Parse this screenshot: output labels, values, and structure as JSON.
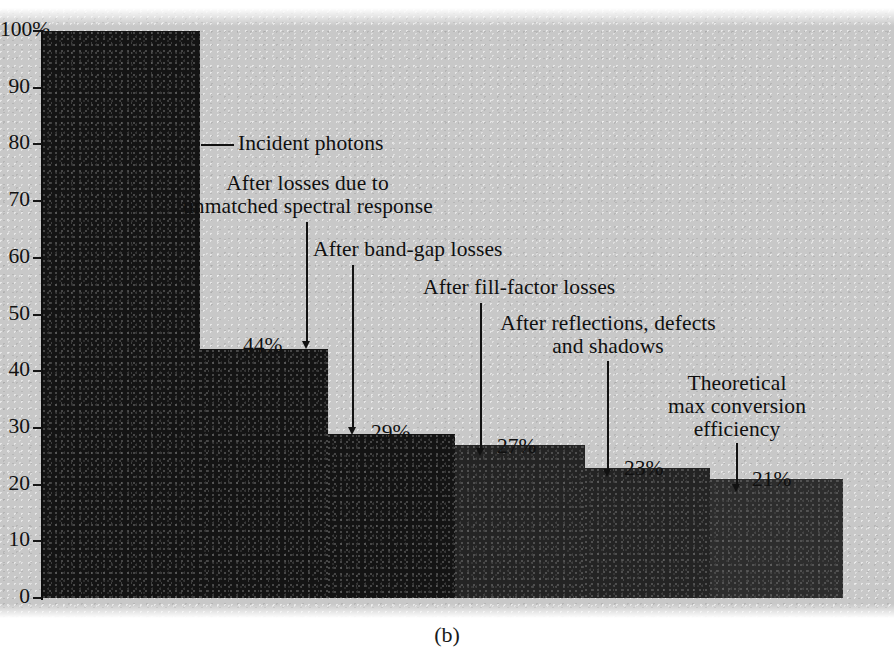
{
  "figure": {
    "caption": "(b)",
    "background_color": "#c8c8c8",
    "bar_color": "#141414"
  },
  "chart_data": {
    "type": "bar",
    "title": "",
    "subtitle": "",
    "xlabel": "",
    "ylabel": "",
    "ylim": [
      0,
      100
    ],
    "grid": false,
    "legend": "none",
    "y_tick_labels": [
      "100%",
      "90",
      "80",
      "70",
      "60",
      "50",
      "40",
      "30",
      "20",
      "10",
      "0"
    ],
    "y_ticks": [
      100,
      90,
      80,
      70,
      60,
      50,
      40,
      30,
      20,
      10,
      0
    ],
    "categories": [
      "Incident photons",
      "After losses due to unmatched spectral response",
      "After band-gap losses",
      "After fill-factor losses",
      "After reflections, defects and shadows",
      "Theoretical max conversion efficiency"
    ],
    "values": [
      100,
      44,
      29,
      27,
      23,
      21
    ],
    "value_labels": [
      "100%",
      "44%",
      "29%",
      "27%",
      "23%",
      "21%"
    ]
  },
  "annotations": [
    {
      "id": "incident-photons",
      "line1": "Incident photons",
      "line2": "",
      "value_label": "100%"
    },
    {
      "id": "unmatched-spectral-response",
      "line1": "After losses due to",
      "line2": "unmatched spectral response",
      "value_label": "44%"
    },
    {
      "id": "band-gap-losses",
      "line1": "After band-gap losses",
      "line2": "",
      "value_label": "29%"
    },
    {
      "id": "fill-factor-losses",
      "line1": "After fill-factor losses",
      "line2": "",
      "value_label": "27%"
    },
    {
      "id": "reflections-defects-shadows",
      "line1": "After reflections, defects",
      "line2": "and shadows",
      "value_label": "23%"
    },
    {
      "id": "theoretical-max-efficiency",
      "line1": "Theoretical",
      "line2": "max conversion",
      "line3": "efficiency",
      "value_label": "21%"
    }
  ]
}
